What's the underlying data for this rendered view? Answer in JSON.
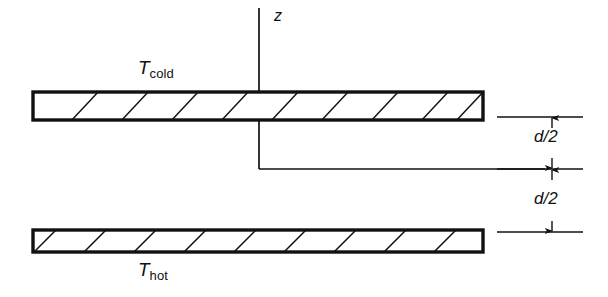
{
  "figure": {
    "type": "technical-diagram",
    "background_color": "#ffffff",
    "line_color": "#111111"
  },
  "axis": {
    "label": "z",
    "vertical_line": {
      "x": 259,
      "y_top": 8,
      "y_bottom": 169
    },
    "label_position": {
      "x": 274,
      "y": 10
    }
  },
  "centerline": {
    "name": "midplane",
    "y": 169,
    "x_start": 259,
    "x_end": 545
  },
  "plates": [
    {
      "name": "cold-plate",
      "label": {
        "symbol": "T",
        "subscript": "cold"
      },
      "label_position": {
        "x": 138,
        "y": 60
      },
      "rect": {
        "x": 33,
        "y": 92,
        "width": 450,
        "height": 28
      },
      "hatch_count": 9,
      "hatch_direction": "forward-slash"
    },
    {
      "name": "hot-plate",
      "label": {
        "symbol": "T",
        "subscript": "hot"
      },
      "label_position": {
        "x": 138,
        "y": 262
      },
      "rect": {
        "x": 33,
        "y": 230,
        "width": 450,
        "height": 22
      },
      "hatch_count": 9,
      "hatch_direction": "forward-slash"
    }
  ],
  "dimensions": [
    {
      "name": "upper-half-gap",
      "label": "d/2",
      "label_position": {
        "x": 534,
        "y": 128
      },
      "arrow_x": 552,
      "y_top": 117,
      "y_bottom": 169
    },
    {
      "name": "lower-half-gap",
      "label": "d/2",
      "label_position": {
        "x": 534,
        "y": 190
      },
      "arrow_x": 552,
      "y_top": 169,
      "y_bottom": 232
    }
  ],
  "extension_lines": [
    {
      "name": "upper-extension-line",
      "y": 117,
      "x_start": 497,
      "x_end": 583
    },
    {
      "name": "mid-extension-line",
      "y": 169,
      "x_start": 497,
      "x_end": 583
    },
    {
      "name": "lower-extension-line",
      "y": 232,
      "x_start": 497,
      "x_end": 583
    }
  ]
}
